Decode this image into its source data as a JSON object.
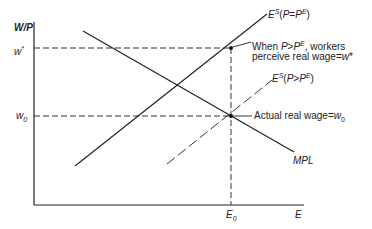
{
  "axes": {
    "y_label": "W/P",
    "x_label": "E",
    "y_ticks": [
      "w*",
      "w0"
    ],
    "x_ticks": [
      "E0"
    ]
  },
  "curves": {
    "es_expected": "E^S(P=P^E)",
    "es_higher": "E^S(P>P^E)",
    "mpl": "MPL"
  },
  "annotations": {
    "perceived_line1": "When P>P^E, workers",
    "perceived_line2": "perceive real wage=w*",
    "actual": "Actual real wage=w0"
  },
  "colors": {
    "line": "#222222",
    "background": "#ffffff"
  }
}
